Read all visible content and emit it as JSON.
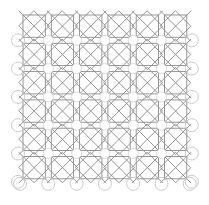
{
  "pattern": {
    "title": "Geometric lattice tile pattern",
    "columns": 6,
    "rows": 6,
    "origin_x": 20,
    "origin_y": 12,
    "cell_size": 28.3,
    "junction_circle_radius": 6.5,
    "colors": {
      "background": "#ffffff",
      "line": "#8a8a8a",
      "circle": "#c4c4c4"
    },
    "stroke_width": 0.9,
    "edge_circles": {
      "left": true,
      "right": true,
      "bottom": true,
      "top": false
    }
  }
}
